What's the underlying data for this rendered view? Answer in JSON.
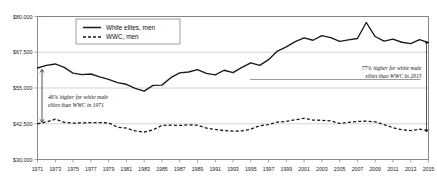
{
  "chart_data": {
    "type": "line",
    "title": "",
    "subtitle": "",
    "xlabel": "",
    "ylabel": "",
    "grid": true,
    "legend_position": "top-left-inside",
    "xlim": [
      1971,
      2015
    ],
    "ylim": [
      30000,
      80000
    ],
    "y_ticks": [
      30000,
      42500,
      55000,
      67500,
      80000
    ],
    "y_tick_labels": [
      "$30,000",
      "$42,500",
      "$55,000",
      "$67,500",
      "$80,000"
    ],
    "x_ticks": [
      1971,
      1973,
      1975,
      1977,
      1979,
      1981,
      1983,
      1985,
      1987,
      1989,
      1991,
      1993,
      1995,
      1997,
      1999,
      2001,
      2003,
      2005,
      2007,
      2009,
      2011,
      2013,
      2015
    ],
    "x_tick_labels": [
      "1971",
      "1973",
      "1975",
      "1977",
      "1979",
      "1981",
      "1983",
      "1985",
      "1987",
      "1989",
      "1991",
      "1993",
      "1995",
      "1997",
      "1999",
      "2001",
      "2003",
      "2005",
      "2007",
      "2009",
      "2011",
      "2013",
      "2015"
    ],
    "x": [
      1971,
      1972,
      1973,
      1974,
      1975,
      1976,
      1977,
      1978,
      1979,
      1980,
      1981,
      1982,
      1983,
      1984,
      1985,
      1986,
      1987,
      1988,
      1989,
      1990,
      1991,
      1992,
      1993,
      1994,
      1995,
      1996,
      1997,
      1998,
      1999,
      2000,
      2001,
      2002,
      2003,
      2004,
      2005,
      2006,
      2007,
      2008,
      2009,
      2010,
      2011,
      2012,
      2013,
      2014,
      2015
    ],
    "series": [
      {
        "name": "White elites, men",
        "style": "solid",
        "color": "#1a1a1a",
        "values": [
          62000,
          62900,
          63400,
          62200,
          60200,
          59700,
          59900,
          58900,
          58000,
          56900,
          56300,
          54900,
          53900,
          55900,
          56000,
          58600,
          60300,
          60600,
          61400,
          60100,
          59600,
          61200,
          60400,
          62200,
          63800,
          62900,
          64900,
          67900,
          69400,
          71200,
          72500,
          71700,
          73300,
          72600,
          71300,
          71800,
          72300,
          77900,
          73000,
          71400,
          72100,
          71000,
          70500,
          71900,
          70900
        ]
      },
      {
        "name": "WWC, men",
        "style": "dashed",
        "color": "#1a1a1a",
        "values": [
          42500,
          43100,
          44100,
          43000,
          42700,
          42800,
          42900,
          42900,
          42800,
          41300,
          41000,
          40000,
          39600,
          40400,
          41900,
          42000,
          41900,
          42100,
          42000,
          41000,
          40500,
          40100,
          39900,
          40000,
          40600,
          41800,
          42200,
          43100,
          43300,
          43900,
          44400,
          43800,
          43700,
          43500,
          42600,
          43000,
          43300,
          43400,
          43200,
          42200,
          41100,
          40400,
          40100,
          40600,
          40100
        ]
      }
    ],
    "annotations": [
      {
        "id": "annotation-1971",
        "text_line1": "46% higher for white male",
        "text_line2": "elites than WWC in 1971",
        "year": 1971,
        "value_top": 62000,
        "value_bottom": 42500
      },
      {
        "id": "annotation-2015",
        "text_line1": "77% higher for white male",
        "text_line2": "elites than WWC in 2015",
        "year": 2015,
        "value_top": 70900,
        "value_bottom": 40100
      }
    ],
    "legend": [
      {
        "label": "White elites, men",
        "style": "solid"
      },
      {
        "label": "WWC, men",
        "style": "dashed"
      }
    ]
  }
}
